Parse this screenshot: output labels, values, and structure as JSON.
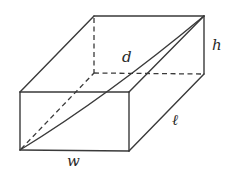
{
  "diagram": {
    "labels": {
      "height": "h",
      "diagonal": "d",
      "length": "ℓ",
      "width": "w"
    },
    "colors": {
      "stroke": "#3a3a3a",
      "text": "#2a2a2a",
      "background": "#ffffff"
    }
  }
}
